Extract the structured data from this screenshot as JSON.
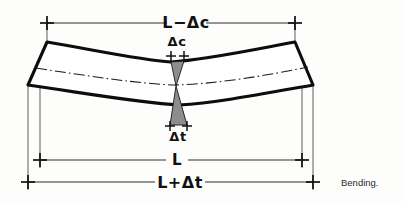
{
  "figure": {
    "caption": "Bending.",
    "background_color": "#fdfdfc",
    "ink_color": "#111111",
    "hatch_color": "#8d8d8d"
  },
  "labels": {
    "top_dimension": "L−Δc",
    "compression_gap": "Δc",
    "tension_gap": "Δt",
    "neutral_length": "L",
    "bottom_dimension": "L+Δt"
  },
  "diagram": {
    "type": "engineering-sketch",
    "elements": [
      "beam-outline",
      "neutral-axis",
      "compression-wedge",
      "tension-wedge",
      "dimension-lines"
    ],
    "dimensions": [
      {
        "name": "top",
        "label": "L−Δc",
        "y": 23,
        "x1": 47,
        "x2": 295,
        "meaning": "shortened top fibre (compression)"
      },
      {
        "name": "neutral",
        "label": "L",
        "y": 160,
        "x1": 40,
        "x2": 302,
        "meaning": "unchanged neutral axis length"
      },
      {
        "name": "bottom",
        "label": "L+Δt",
        "y": 182,
        "x1": 28,
        "x2": 313,
        "meaning": "lengthened bottom fibre (tension)"
      }
    ],
    "gaps": [
      {
        "name": "compression",
        "label": "Δc",
        "y": 56,
        "x1": 171,
        "x2": 184
      },
      {
        "name": "tension",
        "label": "Δt",
        "y": 126,
        "x1": 170,
        "x2": 187
      }
    ]
  }
}
